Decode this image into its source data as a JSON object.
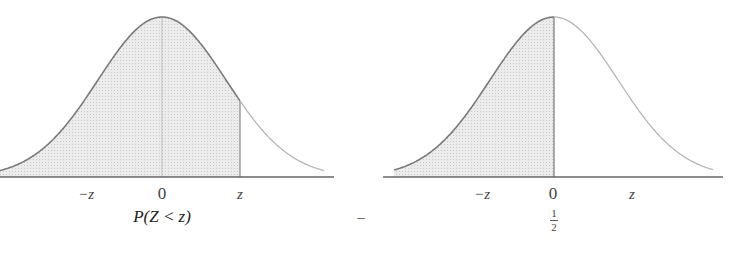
{
  "colors": {
    "curve_dark": "#7a7a7a",
    "curve_light": "#b8b8b8",
    "shade": "#e2e2e2",
    "axis": "#666666"
  },
  "left_panel": {
    "tick_labels": {
      "neg_z": "−z",
      "zero": "0",
      "z": "z"
    },
    "caption": "P(Z < z)",
    "shaded_region": "from -infinity to z"
  },
  "operator": "−",
  "right_panel": {
    "tick_labels": {
      "neg_z": "−z",
      "zero": "0",
      "z": "z"
    },
    "caption": {
      "numerator": "1",
      "denominator": "2"
    },
    "shaded_region": "from -infinity to 0"
  }
}
